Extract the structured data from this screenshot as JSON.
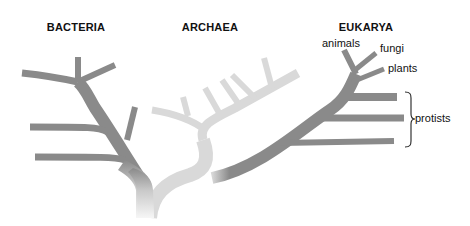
{
  "diagram": {
    "type": "phylogenetic-tree",
    "domains": [
      {
        "id": "bacteria",
        "label": "BACTERIA",
        "color": "#8a8a8a"
      },
      {
        "id": "archaea",
        "label": "ARCHAEA",
        "color": "#d8d8d8"
      },
      {
        "id": "eukarya",
        "label": "EUKARYA",
        "color": "#8a8a8a"
      }
    ],
    "eukarya_groups": [
      {
        "id": "animals",
        "label": "animals"
      },
      {
        "id": "fungi",
        "label": "fungi"
      },
      {
        "id": "plants",
        "label": "plants"
      },
      {
        "id": "protists",
        "label": "protists"
      }
    ]
  }
}
